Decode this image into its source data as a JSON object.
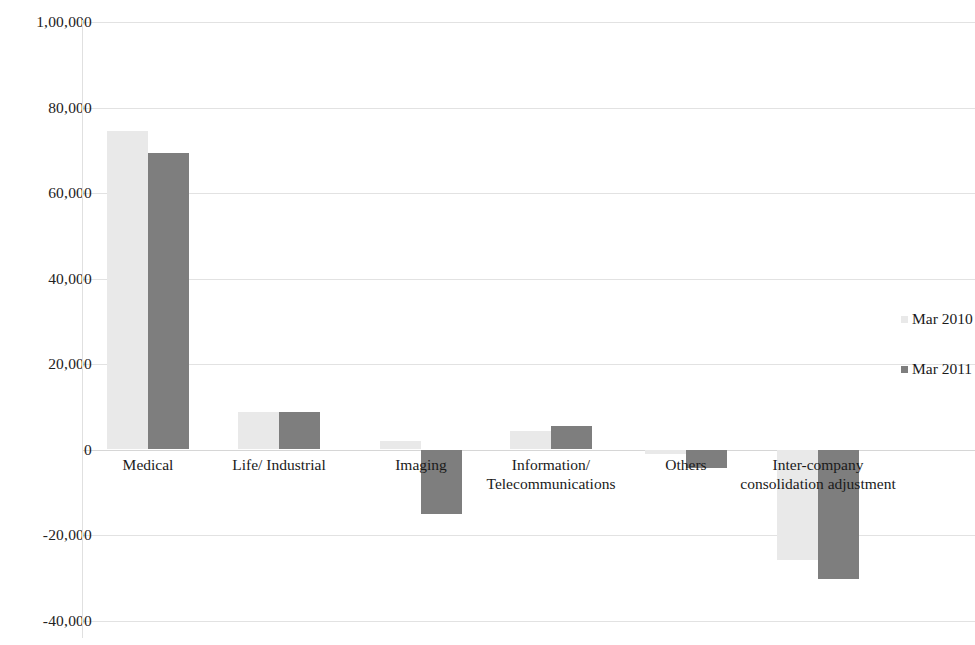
{
  "chart_data": {
    "type": "bar",
    "title": "",
    "subtitle": "",
    "xlabel": "",
    "ylabel": "",
    "grid": true,
    "legend_position": "right",
    "categories": [
      "Medical",
      "Life/ Industrial",
      "Imaging",
      "Information/\nTelecommunications",
      "Others",
      "Inter-company\nconsolidation adjustment"
    ],
    "series": [
      {
        "name": "Mar 2010",
        "color": "#e9e9e9",
        "values": [
          74500,
          8800,
          2100,
          4400,
          -1100,
          -25800
        ]
      },
      {
        "name": "Mar 2011",
        "color": "#7e7e7e",
        "values": [
          69300,
          8800,
          -15000,
          5600,
          -4400,
          -30400
        ]
      }
    ],
    "ylim": [
      -40000,
      100000
    ],
    "ytick_values": [
      100000,
      80000,
      60000,
      40000,
      20000,
      0,
      -20000,
      -40000
    ],
    "ytick_labels": [
      "1,00,000",
      "80,000",
      "60,000",
      "40,000",
      "20,000",
      "0",
      "-20,000",
      "-40,000"
    ]
  },
  "legend": {
    "items": [
      {
        "label": "Mar 2010"
      },
      {
        "label": "Mar 2011"
      }
    ]
  }
}
